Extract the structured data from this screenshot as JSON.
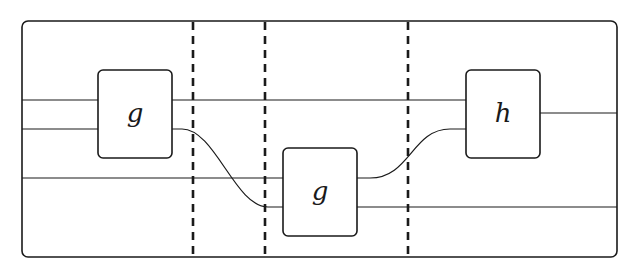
{
  "diagram": {
    "type": "string-diagram",
    "frame": {
      "x": 22,
      "y": 21,
      "width": 595,
      "height": 236,
      "radius": 6
    },
    "separators": [
      {
        "x": 193
      },
      {
        "x": 265
      },
      {
        "x": 408
      }
    ],
    "boxes": [
      {
        "id": "g1",
        "label": "g",
        "x": 98,
        "y": 70,
        "width": 74,
        "height": 88
      },
      {
        "id": "g2",
        "label": "g",
        "x": 283,
        "y": 148,
        "width": 74,
        "height": 88
      },
      {
        "id": "h",
        "label": "h",
        "x": 466,
        "y": 70,
        "width": 74,
        "height": 88
      }
    ],
    "wires": [
      {
        "id": "in-top",
        "from": "frame-left",
        "to": "g1",
        "y": 100
      },
      {
        "id": "in-mid",
        "from": "frame-left",
        "to": "g1",
        "y": 129
      },
      {
        "id": "in-low",
        "from": "frame-left",
        "to": "g2",
        "y": 178
      },
      {
        "id": "g1-out-top",
        "from": "g1",
        "to": "h",
        "y": 100
      },
      {
        "id": "g1-out-bottom",
        "from": "g1",
        "to": "g2",
        "y_from": 129,
        "y_to": 207
      },
      {
        "id": "g2-out-top",
        "from": "g2",
        "to": "h",
        "y_from": 178,
        "y_to": 129
      },
      {
        "id": "g2-out-bottom",
        "from": "g2",
        "to": "frame-right",
        "y": 207
      },
      {
        "id": "h-out",
        "from": "h",
        "to": "frame-right",
        "y": 113
      }
    ]
  }
}
